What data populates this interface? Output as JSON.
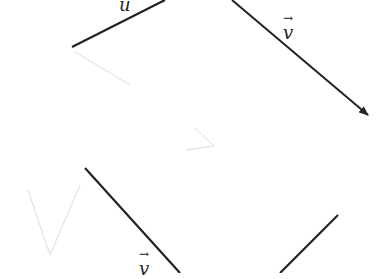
{
  "diagram": {
    "labels": {
      "u": "u",
      "v_top": "v",
      "v_bottom": "v",
      "arrow": "→"
    },
    "segments": [
      {
        "name": "u-segment",
        "from": [
          72,
          47
        ],
        "to": [
          165,
          0
        ]
      },
      {
        "name": "v-vector-top",
        "from": [
          232,
          0
        ],
        "to": [
          368,
          115
        ],
        "arrowhead": true
      },
      {
        "name": "v-segment-bottom",
        "from": [
          85,
          168
        ],
        "to": [
          180,
          273
        ]
      },
      {
        "name": "right-segment-bottom",
        "from": [
          338,
          215
        ],
        "to": [
          280,
          273
        ]
      }
    ],
    "line_color": "#222222",
    "faint_color": "#d8d8d8"
  }
}
